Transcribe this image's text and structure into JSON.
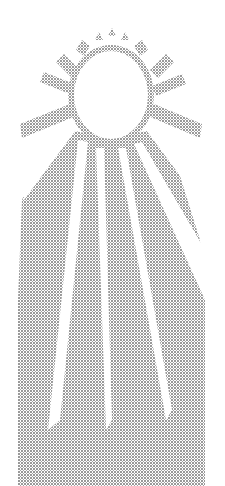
{
  "image": {
    "subject": "halftone sun with radiating rays",
    "background_color": "#ffffff",
    "dot_color": "#6e6e6e",
    "sun_center": [
      111,
      95
    ],
    "sun_radius": [
      38,
      44
    ],
    "short_rays_count": 8,
    "long_rays_count": 6
  }
}
